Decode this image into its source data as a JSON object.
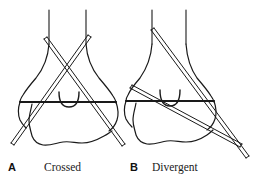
{
  "figure": {
    "kind": "line-drawing",
    "background_color": "#ffffff",
    "ink_color": "#1a1a1a",
    "panels": [
      {
        "letter": "A",
        "title": "Crossed",
        "subject": "distal-tibia-fibula-ankle-with-crossed-pins",
        "pin_count": 2,
        "pin_configuration": "crossed"
      },
      {
        "letter": "B",
        "title": "Divergent",
        "subject": "distal-tibia-fibula-ankle-with-divergent-pins",
        "pin_count": 2,
        "pin_configuration": "divergent"
      }
    ]
  }
}
